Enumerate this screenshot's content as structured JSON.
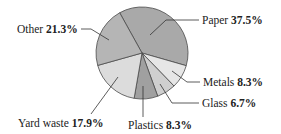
{
  "chart_data": {
    "type": "pie",
    "title": "",
    "categories": [
      "Paper",
      "Metals",
      "Glass",
      "Plastics",
      "Yard waste",
      "Other"
    ],
    "values": [
      37.5,
      8.3,
      6.7,
      8.3,
      17.9,
      21.3
    ],
    "unit": "%",
    "labels": [
      {
        "name": "Paper",
        "value": "37.5%"
      },
      {
        "name": "Metals",
        "value": "8.3%"
      },
      {
        "name": "Glass",
        "value": "6.7%"
      },
      {
        "name": "Plastics",
        "value": "8.3%"
      },
      {
        "name": "Yard waste",
        "value": "17.9%"
      },
      {
        "name": "Other",
        "value": "21.3%"
      }
    ],
    "colors": [
      "#a9a9a9",
      "#e6e6e6",
      "#cfcfcf",
      "#a0a0a0",
      "#dcdcdc",
      "#b5b5b5"
    ],
    "legend": "none (leader-line labels)",
    "start_angle_deg": -119,
    "direction": "clockwise"
  }
}
